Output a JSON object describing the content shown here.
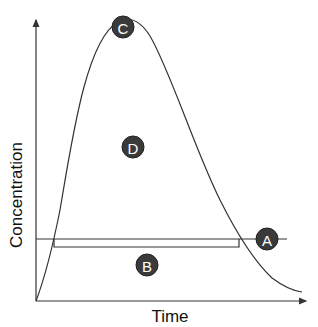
{
  "diagram": {
    "type": "concentration-time curve",
    "x_axis_label": "Time",
    "y_axis_label": "Concentration",
    "markers": {
      "A": "A",
      "B": "B",
      "C": "C",
      "D": "D"
    },
    "colors": {
      "line": "#333333",
      "marker_fill": "#3a3a3a",
      "marker_text": "#ffffff"
    }
  }
}
